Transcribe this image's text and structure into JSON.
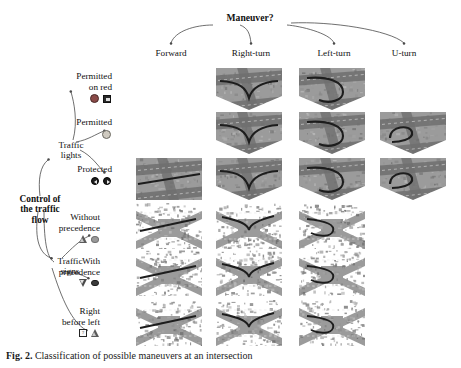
{
  "figure": {
    "root": {
      "label": "Control of\nthe traffic\nflow"
    },
    "maneuver_header": "Maneuver?",
    "columns": [
      {
        "id": "forward",
        "label": "Forward"
      },
      {
        "id": "right-turn",
        "label": "Right-turn"
      },
      {
        "id": "left-turn",
        "label": "Left-turn"
      },
      {
        "id": "u-turn",
        "label": "U-turn"
      }
    ],
    "branches": [
      {
        "id": "traffic-lights",
        "label": "Traffic\nlights"
      },
      {
        "id": "traffic-signs",
        "label": "Traffic\nsigns"
      }
    ],
    "rows": [
      {
        "id": "permitted-on-red",
        "label": "Permitted\non red",
        "branch": "traffic-lights",
        "icons": [
          "red-signal-icon",
          "square-sign-icon"
        ],
        "cells": {
          "forward": false,
          "right-turn": true,
          "left-turn": true,
          "u-turn": false
        },
        "cell_kind": "aerial-intersection"
      },
      {
        "id": "permitted",
        "label": "Permitted",
        "branch": "traffic-lights",
        "icons": [
          "amber-signal-icon"
        ],
        "cells": {
          "forward": false,
          "right-turn": true,
          "left-turn": true,
          "u-turn": true
        },
        "cell_kind": "aerial-intersection"
      },
      {
        "id": "protected",
        "label": "Protected",
        "branch": "traffic-lights",
        "icons": [
          "left-arrow-signal-icon",
          "right-arrow-signal-icon"
        ],
        "cells": {
          "forward": true,
          "right-turn": true,
          "left-turn": true,
          "u-turn": true
        },
        "cell_kind": "aerial-intersection"
      },
      {
        "id": "without-precedence",
        "label": "Without\nprecedence",
        "branch": "traffic-signs",
        "icons": [
          "warning-triangle-icon",
          "round-sign-icon"
        ],
        "cells": {
          "forward": true,
          "right-turn": true,
          "left-turn": true,
          "u-turn": false
        },
        "cell_kind": "aerial-crossroad"
      },
      {
        "id": "with-precedence",
        "label": "With\nprecedence",
        "branch": "traffic-signs",
        "icons": [
          "yield-triangle-icon",
          "priority-sign-icon"
        ],
        "cells": {
          "forward": true,
          "right-turn": true,
          "left-turn": true,
          "u-turn": false
        },
        "cell_kind": "aerial-crossroad"
      },
      {
        "id": "right-before-left",
        "label": "Right\nbefore left",
        "branch": "traffic-signs",
        "icons": [
          "question-sign-icon",
          "warning-triangle-icon"
        ],
        "cells": {
          "forward": true,
          "right-turn": true,
          "left-turn": true,
          "u-turn": false
        },
        "cell_kind": "aerial-crossroad"
      }
    ],
    "caption": {
      "prefix": "Fig. 2.",
      "rest": " Classification of possible maneuvers at an intersection"
    }
  },
  "colors": {
    "ink": "#111111",
    "connector": "#4a4a4a",
    "thumb_base": "#9b9b9b",
    "road": "#6f6f6f",
    "marking": "#e6e6e6",
    "path": "#1d1d1d"
  }
}
